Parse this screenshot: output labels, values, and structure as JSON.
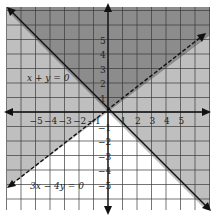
{
  "chart_data": {
    "type": "region",
    "title": "",
    "xlabel": "",
    "ylabel": "",
    "xlim": [
      -7,
      7
    ],
    "ylim": [
      -7,
      7
    ],
    "grid": true,
    "x_ticks": [
      -5,
      -4,
      -3,
      -2,
      -1,
      1,
      2,
      3,
      4,
      5
    ],
    "y_ticks": [
      5,
      4,
      3,
      2,
      1,
      -1,
      -2,
      -3,
      -4,
      -5
    ],
    "x_tick_labels": [
      "−5",
      "−4",
      "−3",
      "−2",
      "−1",
      "1",
      "2",
      "3",
      "4",
      "5"
    ],
    "y_tick_labels": [
      "5",
      "4",
      "3",
      "2",
      "1",
      "−1",
      "−2",
      "−3",
      "−4",
      "−5"
    ],
    "lines": [
      {
        "equation": "x + y = 0",
        "slope": -1,
        "style": "solid",
        "label": "x + y = 0"
      },
      {
        "equation": "3x − 4y = 0",
        "slope": 0.75,
        "style": "dashed",
        "label": "3x − 4y = 0"
      }
    ],
    "regions": [
      {
        "name": "top",
        "condition": "x + y > 0 and 3x − 4y < 0",
        "shade": "dark"
      },
      {
        "name": "left",
        "condition": "x + y < 0 and 3x − 4y < 0",
        "shade": "light"
      },
      {
        "name": "right",
        "condition": "x + y > 0 and 3x − 4y > 0",
        "shade": "light"
      },
      {
        "name": "bottom",
        "condition": "x + y < 0 and 3x − 4y > 0",
        "shade": "none"
      }
    ],
    "colors": {
      "dark_region": "#8c8c8c",
      "light_region": "#bfbfbf",
      "none_region": "#ffffff",
      "grid": "#3a3a3a",
      "axis": "#111111"
    }
  },
  "labels": {
    "line1": "x + y = 0",
    "line2": "3x − 4y = 0"
  },
  "ticks": {
    "x": [
      "−5",
      "−4",
      "−3",
      "−2",
      "−1",
      "1",
      "2",
      "3",
      "4",
      "5"
    ],
    "y": [
      "5",
      "4",
      "3",
      "2",
      "1",
      "−1",
      "−2",
      "−3",
      "−4",
      "−5"
    ]
  }
}
